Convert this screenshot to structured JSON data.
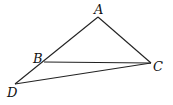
{
  "diagram": {
    "type": "geometry-figure",
    "points": [
      {
        "label": "A",
        "x": 98,
        "y": 17,
        "lx": 94,
        "ly": 14
      },
      {
        "label": "B",
        "x": 44,
        "y": 62,
        "lx": 33,
        "ly": 63
      },
      {
        "label": "C",
        "x": 151,
        "y": 63,
        "lx": 153,
        "ly": 71
      },
      {
        "label": "D",
        "x": 15,
        "y": 84,
        "lx": 7,
        "ly": 97
      }
    ],
    "segments": [
      {
        "from": "A",
        "to": "D"
      },
      {
        "from": "A",
        "to": "C"
      },
      {
        "from": "B",
        "to": "C"
      },
      {
        "from": "D",
        "to": "C"
      }
    ],
    "colors": {
      "stroke": "#222222",
      "label": "#111111",
      "background": "#ffffff"
    }
  }
}
